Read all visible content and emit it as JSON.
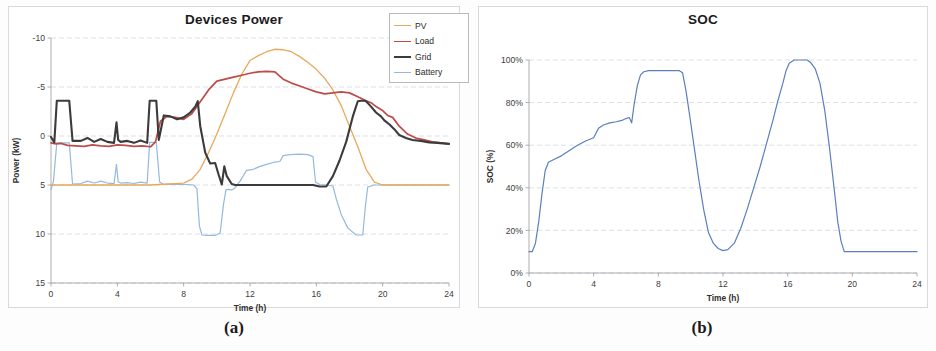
{
  "figure": {
    "panels": [
      {
        "caption": "(a)",
        "title": "Devices Power"
      },
      {
        "caption": "(b)",
        "title": "SOC"
      }
    ]
  },
  "chart_data": [
    {
      "type": "line",
      "title": "Devices Power",
      "xlabel": "Time (h)",
      "ylabel": "Power (kW)",
      "xlim": [
        0,
        24
      ],
      "ylim": [
        -10,
        15
      ],
      "xticks": [
        0,
        4,
        8,
        12,
        16,
        20,
        24
      ],
      "yticks": [
        -10,
        -5,
        0,
        5,
        10,
        15
      ],
      "grid": true,
      "legend_position": "top-right",
      "colors": {
        "PV": "#E8A85A",
        "Load": "#BE4B48",
        "Grid": "#3B3B3B",
        "Battery": "#95B9DC"
      },
      "series": [
        {
          "name": "PV",
          "color": "#E8A85A",
          "x": [
            0,
            1,
            2,
            3,
            4,
            5,
            6,
            6.5,
            7,
            7.5,
            8,
            8.5,
            9,
            9.5,
            10,
            10.5,
            11,
            11.5,
            12,
            12.5,
            13,
            13.5,
            14,
            14.5,
            15,
            15.5,
            16,
            16.5,
            17,
            17.5,
            18,
            18.5,
            19,
            19.5,
            20,
            21,
            22,
            23,
            24
          ],
          "values": [
            0,
            0,
            0,
            0,
            0,
            0,
            0,
            0.05,
            0.1,
            0.15,
            0.2,
            0.6,
            1.6,
            3.3,
            5.2,
            7.3,
            9.4,
            11.3,
            12.7,
            13.2,
            13.6,
            13.85,
            13.8,
            13.6,
            13.1,
            12.5,
            11.8,
            10.9,
            9.7,
            8.1,
            6.0,
            3.9,
            1.6,
            0.3,
            0,
            0,
            0,
            0,
            0
          ]
        },
        {
          "name": "Load",
          "color": "#BE4B48",
          "x": [
            0,
            0.3,
            0.6,
            1,
            1.5,
            2,
            2.5,
            3,
            3.5,
            4,
            4.5,
            5,
            5.5,
            6,
            6.3,
            6.6,
            7,
            7.5,
            8,
            8.5,
            9,
            9.5,
            10,
            10.5,
            11,
            11.5,
            12,
            12.5,
            13,
            13.5,
            14,
            14.5,
            15,
            15.5,
            16,
            16.5,
            17,
            17.5,
            18,
            18.5,
            19,
            19.3,
            19.6,
            20,
            20.3,
            20.6,
            21,
            21.5,
            22,
            22.5,
            23,
            23.5,
            24
          ],
          "values": [
            4.3,
            4.2,
            4.25,
            4.05,
            4.0,
            3.95,
            4.1,
            4.0,
            3.95,
            4.1,
            4.05,
            3.95,
            4.0,
            3.9,
            4.4,
            6.5,
            7.0,
            6.9,
            6.7,
            7.3,
            8.5,
            9.7,
            10.6,
            10.8,
            11.0,
            11.2,
            11.4,
            11.55,
            11.6,
            11.55,
            10.8,
            10.4,
            10.1,
            9.8,
            9.5,
            9.3,
            9.4,
            9.5,
            9.4,
            9.0,
            8.6,
            8.4,
            8.0,
            7.6,
            7.1,
            6.9,
            6.0,
            5.2,
            4.8,
            4.6,
            4.4,
            4.3,
            4.2
          ]
        },
        {
          "name": "Grid",
          "color": "#3B3B3B",
          "x": [
            0,
            0.2,
            0.35,
            1.1,
            1.3,
            1.8,
            2.2,
            2.6,
            3.0,
            3.4,
            3.8,
            3.95,
            4.05,
            4.2,
            4.6,
            5.0,
            5.4,
            5.8,
            5.95,
            6.1,
            6.35,
            6.5,
            6.8,
            7.2,
            7.6,
            8.0,
            8.4,
            8.7,
            8.85,
            9.0,
            9.3,
            9.6,
            9.9,
            10.1,
            10.3,
            10.45,
            10.6,
            10.9,
            11.1,
            11.3,
            11.6,
            11.9,
            12.2,
            13,
            14,
            15,
            15.8,
            16.2,
            16.6,
            17.0,
            17.4,
            17.8,
            18.2,
            18.5,
            18.7,
            18.9,
            19.0,
            19.3,
            19.6,
            19.9,
            20.1,
            20.4,
            20.7,
            21.0,
            21.4,
            21.8,
            22.3,
            22.8,
            23.3,
            24
          ],
          "values": [
            4.9,
            4.35,
            8.6,
            8.6,
            4.5,
            4.5,
            4.8,
            4.4,
            4.7,
            4.4,
            4.3,
            6.4,
            4.6,
            4.4,
            4.5,
            4.3,
            4.55,
            4.3,
            8.6,
            8.6,
            8.6,
            4.6,
            7.1,
            7.0,
            6.7,
            6.9,
            7.4,
            8.0,
            8.55,
            6.0,
            3.3,
            2.2,
            2.25,
            1.1,
            0.05,
            1.9,
            0.9,
            0.1,
            0.0,
            0.0,
            0.0,
            0.0,
            0.0,
            0.0,
            0.0,
            0.0,
            0.0,
            -0.15,
            -0.15,
            0.9,
            2.5,
            4.4,
            7.0,
            8.55,
            8.6,
            8.6,
            8.55,
            8.0,
            7.4,
            7.0,
            6.6,
            6.2,
            5.7,
            5.1,
            4.8,
            4.6,
            4.5,
            4.35,
            4.3,
            4.2
          ]
        },
        {
          "name": "Battery",
          "color": "#95B9DC",
          "x": [
            0,
            0.15,
            0.35,
            1.1,
            1.3,
            1.8,
            2.2,
            2.6,
            3.0,
            3.4,
            3.8,
            3.95,
            4.05,
            4.2,
            4.6,
            5.0,
            5.4,
            5.8,
            5.95,
            6.1,
            6.35,
            6.55,
            6.8,
            7.5,
            8.2,
            8.6,
            8.8,
            8.95,
            9.1,
            9.4,
            9.9,
            10.2,
            10.4,
            10.55,
            10.7,
            10.9,
            11.1,
            11.4,
            11.8,
            12.2,
            12.6,
            13.0,
            13.4,
            13.8,
            14.0,
            14.4,
            15.0,
            15.5,
            15.8,
            15.95,
            16.2,
            16.6,
            17.0,
            17.2,
            17.5,
            17.9,
            18.4,
            18.8,
            18.95,
            19.1,
            19.5,
            20,
            21,
            22,
            23,
            24
          ],
          "values": [
            -0.5,
            0.4,
            4.3,
            4.3,
            0.1,
            0.15,
            0.4,
            0.2,
            0.4,
            0.2,
            0.15,
            2.1,
            0.3,
            0.2,
            0.25,
            0.15,
            0.3,
            0.2,
            4.35,
            4.35,
            4.35,
            0.3,
            0.05,
            0.05,
            0.05,
            0.0,
            -0.4,
            -4.2,
            -5.1,
            -5.15,
            -5.15,
            -4.9,
            -2.0,
            -0.5,
            -0.45,
            -0.5,
            -0.3,
            0.4,
            1.5,
            1.6,
            1.9,
            2.1,
            2.3,
            2.4,
            3.0,
            3.1,
            3.15,
            3.1,
            2.9,
            0.3,
            0.05,
            0.0,
            -0.1,
            -1.4,
            -3.0,
            -4.4,
            -5.1,
            -5.1,
            -2.3,
            -0.2,
            0.0,
            0.0,
            0.0,
            0.0,
            0.0,
            0.0
          ]
        }
      ]
    },
    {
      "type": "line",
      "title": "SOC",
      "xlabel": "Time (h)",
      "ylabel": "SOC (%)",
      "xlim": [
        0,
        24
      ],
      "ylim": [
        0,
        100
      ],
      "xticks": [
        0,
        4,
        8,
        12,
        16,
        20,
        24
      ],
      "yticks": [
        0,
        20,
        40,
        60,
        80,
        100
      ],
      "ytick_labels": [
        "0%",
        "20%",
        "40%",
        "60%",
        "80%",
        "100%"
      ],
      "grid": true,
      "legend_position": "none",
      "colors": {
        "SOC": "#5B7FBD"
      },
      "series": [
        {
          "name": "SOC",
          "color": "#5B7FBD",
          "x": [
            0,
            0.2,
            0.4,
            0.6,
            0.8,
            1.0,
            1.2,
            1.6,
            2.0,
            2.5,
            3.0,
            3.5,
            4.0,
            4.3,
            4.6,
            5.0,
            5.4,
            5.8,
            6.0,
            6.2,
            6.35,
            6.5,
            6.7,
            6.9,
            7.1,
            7.4,
            7.8,
            8.2,
            8.6,
            9.0,
            9.3,
            9.5,
            9.7,
            9.9,
            10.2,
            10.5,
            10.8,
            11.1,
            11.4,
            11.7,
            12.0,
            12.3,
            12.7,
            13.1,
            13.5,
            13.9,
            14.3,
            14.7,
            15.1,
            15.4,
            15.7,
            15.9,
            16.1,
            16.4,
            16.7,
            17.0,
            17.2,
            17.4,
            17.7,
            18.0,
            18.3,
            18.6,
            18.9,
            19.1,
            19.3,
            19.5,
            20,
            21,
            22,
            23,
            24
          ],
          "values": [
            10,
            10,
            14,
            24,
            37,
            48,
            52,
            53.5,
            55,
            57.5,
            60,
            62,
            63.5,
            68,
            69.5,
            70.5,
            71,
            71.8,
            72.5,
            73,
            70.5,
            79,
            88,
            93,
            94.5,
            95,
            95,
            95,
            95,
            95,
            95,
            94,
            86,
            76,
            60,
            44,
            30,
            19,
            14,
            11.5,
            10.5,
            11,
            14,
            21,
            30,
            40,
            50,
            61,
            72,
            81,
            89,
            95,
            98.5,
            100,
            100,
            100,
            100,
            99,
            96,
            89,
            76,
            58,
            38,
            24,
            15,
            10,
            10,
            10,
            10,
            10,
            10
          ]
        }
      ]
    }
  ],
  "panel_a": {
    "title": "Devices Power",
    "caption": "(a)",
    "xlabel": "Time (h)",
    "ylabel": "Power (kW)",
    "xticks": [
      "0",
      "4",
      "8",
      "12",
      "16",
      "20",
      "24"
    ],
    "yticks": [
      "15",
      "10",
      "5",
      "0",
      "-5",
      "-10"
    ],
    "legend": [
      {
        "label": "PV",
        "color": "#E8A85A",
        "width": 1.3
      },
      {
        "label": "Load",
        "color": "#BE4B48",
        "width": 1.6
      },
      {
        "label": "Grid",
        "color": "#3B3B3B",
        "width": 2.2
      },
      {
        "label": "Battery",
        "color": "#95B9DC",
        "width": 1.3
      }
    ]
  },
  "panel_b": {
    "title": "SOC",
    "caption": "(b)",
    "xlabel": "Time (h)",
    "ylabel": "SOC (%)",
    "xticks": [
      "0",
      "4",
      "8",
      "12",
      "16",
      "20",
      "24"
    ],
    "yticks": [
      "100%",
      "80%",
      "60%",
      "40%",
      "20%",
      "0%"
    ]
  }
}
